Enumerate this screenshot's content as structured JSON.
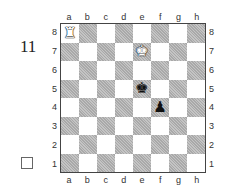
{
  "diagram": {
    "number": "11",
    "to_move_indicator": "white-to-move-box",
    "files": [
      "a",
      "b",
      "c",
      "d",
      "e",
      "f",
      "g",
      "h"
    ],
    "ranks": [
      "8",
      "7",
      "6",
      "5",
      "4",
      "3",
      "2",
      "1"
    ],
    "pieces": [
      {
        "square": "a8",
        "color": "white",
        "type": "rook",
        "glyph": "♜"
      },
      {
        "square": "e7",
        "color": "white",
        "type": "king",
        "glyph": "♚"
      },
      {
        "square": "e5",
        "color": "black",
        "type": "king",
        "glyph": "♚"
      },
      {
        "square": "f4",
        "color": "black",
        "type": "pawn",
        "glyph": "♟"
      }
    ],
    "colors": {
      "light": "#ffffff",
      "dark": "#b8b8b8",
      "border": "#444444"
    }
  }
}
